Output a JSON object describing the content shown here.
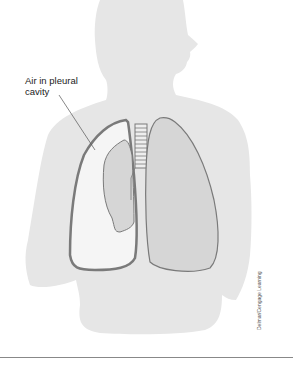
{
  "figure": {
    "label_line1": "Air in pleural",
    "label_line2": "cavity",
    "credit": "Delmar/Cengage Learning",
    "colors": {
      "silhouette": "#e6e6e6",
      "lung_fill": "#d6d6d6",
      "lung_stroke": "#7a7a7a",
      "air_space": "#f5f5f5",
      "rule": "#888888"
    }
  }
}
